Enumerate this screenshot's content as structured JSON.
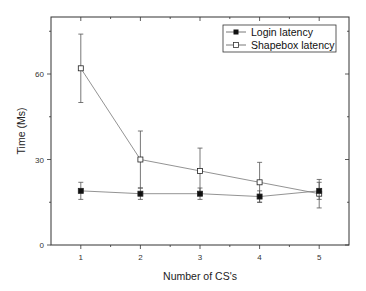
{
  "chart_data": {
    "type": "line",
    "title": "",
    "xlabel": "Number of CS's",
    "ylabel": "Time (Ms)",
    "x": [
      1,
      2,
      3,
      4,
      5
    ],
    "xlim": [
      0.5,
      5.5
    ],
    "ylim": [
      0,
      80
    ],
    "xticks": [
      1,
      2,
      3,
      4,
      5
    ],
    "yticks": [
      0,
      30,
      60
    ],
    "grid": false,
    "legend_position": "upper right",
    "series": [
      {
        "name": "Login latency",
        "marker": "filled-square",
        "values": [
          19,
          18,
          18,
          17,
          19
        ],
        "error_low": [
          16,
          16,
          16,
          15,
          16
        ],
        "error_high": [
          22,
          20,
          20,
          19,
          22
        ]
      },
      {
        "name": "Shapebox latency",
        "marker": "open-square",
        "values": [
          62,
          30,
          26,
          22,
          18
        ],
        "error_low": [
          50,
          20,
          18,
          15,
          13
        ],
        "error_high": [
          74,
          40,
          34,
          29,
          23
        ]
      }
    ]
  },
  "colors": {
    "axis": "#333333",
    "line": "#777777",
    "errorbar": "#555555",
    "marker_fill_login": "#111111",
    "marker_fill_shapebox": "#ffffff"
  }
}
